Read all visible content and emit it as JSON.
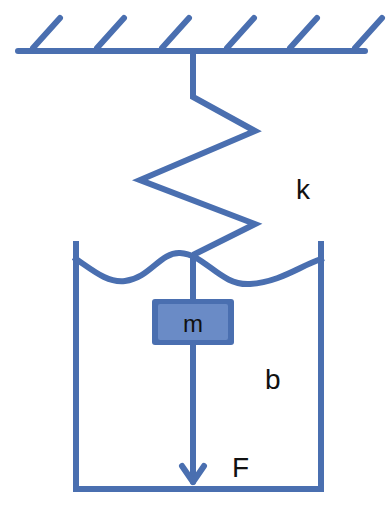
{
  "diagram": {
    "colors": {
      "stroke": "#4a6fb0",
      "mass_fill": "#4a6fb0",
      "mass_inner": "#5f82c0",
      "label": "#111111",
      "background": "#ffffff"
    },
    "labels": {
      "spring": "k",
      "mass": "m",
      "damper": "b",
      "force": "F"
    },
    "components": {
      "ceiling": "fixed-support-hatched",
      "spring": "zigzag-spring",
      "mass": "block",
      "damper": "fluid-container",
      "force": "downward-arrow"
    }
  }
}
